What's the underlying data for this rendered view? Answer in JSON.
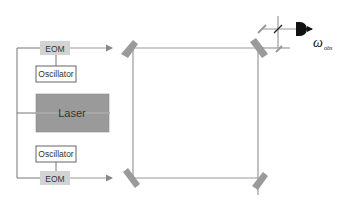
{
  "diagram": {
    "components": {
      "eom_top": {
        "label": "EOM"
      },
      "oscillator_top": {
        "label": "Oscillator"
      },
      "laser": {
        "label": "Laser"
      },
      "oscillator_bottom": {
        "label": "Oscillator"
      },
      "eom_bottom": {
        "label": "EOM"
      },
      "detector": {
        "label": "ω",
        "subscript": "obs"
      }
    },
    "mirrors": [
      "top-left",
      "top-right",
      "bottom-left",
      "bottom-right"
    ],
    "colors": {
      "beam": "#9a9a9a",
      "laser_fill": "#9a9a9a",
      "eom_fill": "#d3d3d3",
      "detector": "#111111"
    }
  }
}
